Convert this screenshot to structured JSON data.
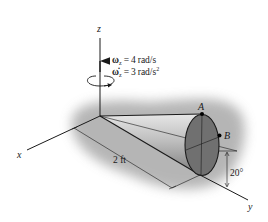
{
  "figure": {
    "type": "engineering-dynamics-diagram",
    "axes": {
      "x_label": "x",
      "y_label": "y",
      "z_label": "z"
    },
    "angular_velocity": {
      "symbol": "ω",
      "subscript": "z",
      "equals": "=",
      "value": "4",
      "unit": "rad/s"
    },
    "angular_acceleration": {
      "symbol": "ω̇",
      "subscript": "z",
      "equals": "=",
      "value": "3",
      "unit": "rad/s",
      "unit_exponent": "2"
    },
    "points": {
      "a_label": "A",
      "b_label": "B"
    },
    "dimensions": {
      "length_label": "2 ft",
      "angle_label": "20°"
    },
    "colors": {
      "line": "#1a1a1a",
      "cone_base": "#6f6f6f",
      "cone_body_light": "#d9d9d9",
      "cone_body_dark": "#8a8a8a",
      "shadow": "#9a9a9a",
      "background": "#ffffff"
    }
  }
}
